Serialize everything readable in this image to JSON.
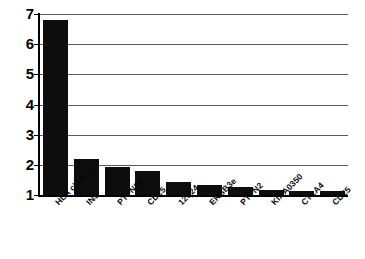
{
  "chart_data": {
    "type": "bar",
    "title": "",
    "subtitle": "",
    "xlabel": "",
    "ylabel": "",
    "categories": [
      "HLA class II",
      "INS",
      "PTPN22",
      "CD25",
      "12q24",
      "ERBB3e",
      "PTPN2",
      "KIAA0350",
      "CTLA4",
      "CD25"
    ],
    "values": [
      6.8,
      2.2,
      1.92,
      1.78,
      1.42,
      1.32,
      1.27,
      1.17,
      1.12,
      1.12
    ],
    "ylim": [
      1,
      7
    ],
    "yticks": [
      1,
      2,
      3,
      4,
      5,
      6,
      7
    ],
    "ytick_labels": [
      "1",
      "2",
      "3",
      "4",
      "5",
      "6",
      "7"
    ],
    "grid": true,
    "legend": "none",
    "bar_color": "#0d0d0d",
    "gridline_color": "#5b5b5b",
    "axis_color": "#000000",
    "background_color": "#ffffff"
  }
}
